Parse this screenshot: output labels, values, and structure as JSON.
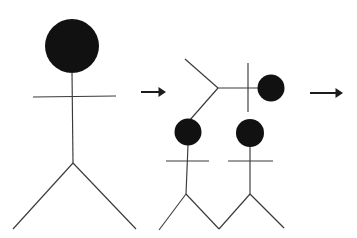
{
  "diagram": {
    "background_color": "#ffffff",
    "line_color": "#3a3a3a",
    "blob_color": "#111111",
    "arrow_color": "#1c1c1c",
    "width": 357,
    "height": 238,
    "stage_count": 3,
    "arrow_count": 2
  },
  "stages": [
    {
      "id": "stage-1",
      "label": "whole-stick-figure",
      "description": "Complete stick figure: filled circular head, vertical spine, horizontal arms bar, two splayed legs",
      "parts": {
        "head": {
          "cx": 72,
          "cy": 46,
          "r": 27
        },
        "spine": {
          "x1": 72,
          "y1": 72,
          "x2": 73,
          "y2": 163
        },
        "arms": {
          "x1": 33,
          "y1": 97,
          "x2": 116,
          "y2": 96
        },
        "leg_left": {
          "x1": 73,
          "y1": 163,
          "x2": 13,
          "y2": 229
        },
        "leg_right": {
          "x1": 73,
          "y1": 163,
          "x2": 136,
          "y2": 229
        }
      }
    },
    {
      "id": "stage-2",
      "label": "rearranged-stick-figure-parts",
      "description": "Disassembled parts: a rotated V of legs pointing right, a horizontal spine with vertical cross bar and detached head blob, plus two smaller stick figures below each topped with a blob head",
      "parts": {
        "v_vertex": {
          "x": 218,
          "y": 88
        },
        "v_upper_end": {
          "x": 185,
          "y": 59
        },
        "v_lower_end": {
          "x": 189,
          "y": 121
        },
        "horizontal_spine": {
          "x1": 218,
          "y1": 88,
          "x2": 259,
          "y2": 88
        },
        "vertical_crossbar": {
          "x": 248,
          "y1": 63,
          "y2": 112
        },
        "detached_head": {
          "cx": 271,
          "cy": 88,
          "r": 13.5
        },
        "sub_left": {
          "head": {
            "cx": 188,
            "cy": 132,
            "r": 13.5
          },
          "spine": {
            "x1": 188,
            "y1": 145,
            "x2": 186,
            "y2": 194
          },
          "arms": {
            "x1": 166,
            "y1": 161,
            "x2": 209,
            "y2": 161
          },
          "leg_left": {
            "x1": 186,
            "y1": 194,
            "x2": 159,
            "y2": 230
          },
          "leg_right": {
            "x1": 186,
            "y1": 194,
            "x2": 219,
            "y2": 229
          }
        },
        "sub_right": {
          "head": {
            "cx": 250,
            "cy": 133,
            "r": 14
          },
          "spine": {
            "x1": 250,
            "y1": 147,
            "x2": 250,
            "y2": 194
          },
          "arms": {
            "x1": 228,
            "y1": 161,
            "x2": 273,
            "y2": 161
          },
          "leg_left": {
            "x1": 250,
            "y1": 194,
            "x2": 219,
            "y2": 229
          },
          "leg_right": {
            "x1": 250,
            "y1": 194,
            "x2": 284,
            "y2": 228
          }
        }
      }
    },
    {
      "id": "stage-3",
      "label": "offscreen-result",
      "description": "Third stage is cropped out of frame past the right arrow"
    }
  ],
  "arrows": [
    {
      "id": "arrow-1",
      "label": "transform-arrow-left",
      "direction": "right",
      "x1": 141,
      "y": 92,
      "x2": 166
    },
    {
      "id": "arrow-2",
      "label": "transform-arrow-right",
      "direction": "right",
      "x1": 310,
      "y": 93,
      "x2": 343
    }
  ],
  "chart_data": {
    "type": "diagram"
  }
}
